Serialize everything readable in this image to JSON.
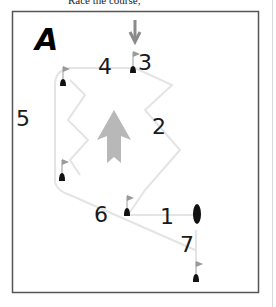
{
  "caption": "Race the course,",
  "diagram": {
    "panel_label": "A",
    "legs": [
      {
        "id": "leg-1",
        "label": "1"
      },
      {
        "id": "leg-2",
        "label": "2"
      },
      {
        "id": "leg-3",
        "label": "3"
      },
      {
        "id": "leg-4",
        "label": "4"
      },
      {
        "id": "leg-5",
        "label": "5"
      },
      {
        "id": "leg-6",
        "label": "6"
      },
      {
        "id": "leg-7",
        "label": "7"
      }
    ],
    "wind_arrow": "down",
    "course_arrow": "up",
    "colors": {
      "frame": "#555555",
      "buoy": "#111111",
      "flag": "#9a9a9a",
      "arrow": "#b8b8b8",
      "path": "#e4e4e4"
    }
  }
}
